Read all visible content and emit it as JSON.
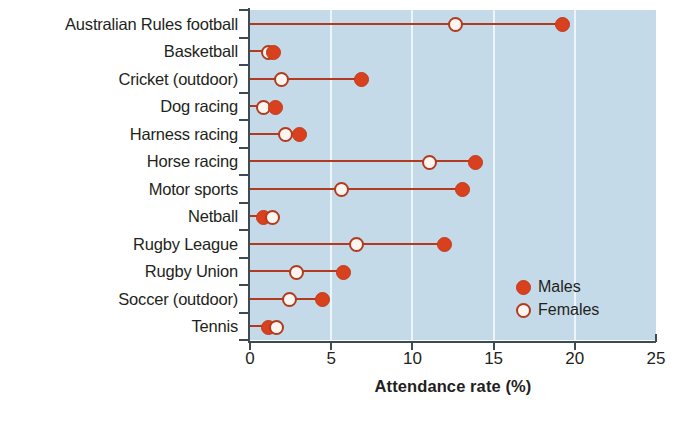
{
  "chart_data": {
    "type": "scatter",
    "subtype": "dumbbell-dot-plot",
    "title": "",
    "xlabel": "Attendance rate (%)",
    "ylabel": "",
    "xlim": [
      0,
      25
    ],
    "xticks": [
      0,
      5,
      10,
      15,
      20,
      25
    ],
    "xtick_labels": [
      "0",
      "5",
      "10",
      "15",
      "20",
      "25"
    ],
    "grid": "vertical-only",
    "legend_position": "inside-lower-right",
    "categories": [
      "Australian Rules football",
      "Basketball",
      "Cricket (outdoor)",
      "Dog racing",
      "Harness racing",
      "Horse racing",
      "Motor sports",
      "Netball",
      "Rugby League",
      "Rugby Union",
      "Soccer (outdoor)",
      "Tennis"
    ],
    "series": [
      {
        "name": "Males",
        "marker": "filled-circle",
        "color": "#d9411e",
        "values": [
          19.2,
          1.4,
          6.8,
          1.5,
          3.0,
          13.8,
          13.0,
          0.8,
          11.9,
          5.7,
          4.4,
          1.1
        ]
      },
      {
        "name": "Females",
        "marker": "open-circle",
        "color": "#b23a1e",
        "values": [
          12.6,
          1.1,
          1.9,
          0.8,
          2.1,
          11.0,
          5.6,
          1.3,
          6.5,
          2.8,
          2.4,
          1.6
        ]
      }
    ],
    "plot_background_color": "#c5dae8",
    "gridline_color": "#eef5fa",
    "axis_color": "#3d4b55",
    "connector_color": "#b23a1e"
  },
  "legend": {
    "items": [
      {
        "label": "Males",
        "marker": "filled-circle"
      },
      {
        "label": "Females",
        "marker": "open-circle"
      }
    ]
  }
}
